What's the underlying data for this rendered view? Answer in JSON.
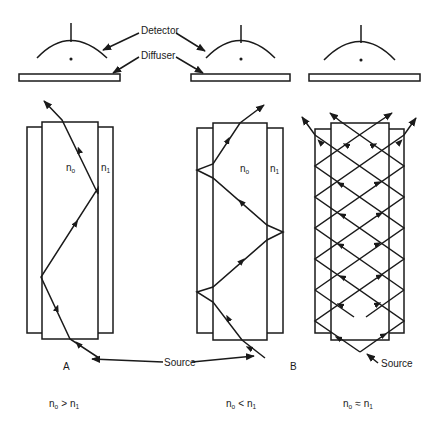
{
  "diagram": {
    "type": "optical-fiber-light-propagation",
    "labels": {
      "detector": "Detector",
      "diffuser": "Diffuser",
      "source": "Source",
      "core_index": "n",
      "core_index_sub": "o",
      "cladding_index": "n",
      "cladding_index_sub": "1"
    },
    "panels": [
      {
        "id": "A",
        "letter": "A",
        "condition_lhs": "n",
        "condition_lhs_sub": "o",
        "condition_op": ">",
        "condition_rhs": "n",
        "condition_rhs_sub": "1"
      },
      {
        "id": "B",
        "letter": "B",
        "condition_lhs": "n",
        "condition_lhs_sub": "o",
        "condition_op": "<",
        "condition_rhs": "n",
        "condition_rhs_sub": "1"
      },
      {
        "id": "C",
        "letter": "",
        "condition_lhs": "n",
        "condition_lhs_sub": "o",
        "condition_op": "≈",
        "condition_rhs": "n",
        "condition_rhs_sub": "1"
      }
    ],
    "colors": {
      "line": "#1a1a1a",
      "background": "#ffffff"
    }
  }
}
